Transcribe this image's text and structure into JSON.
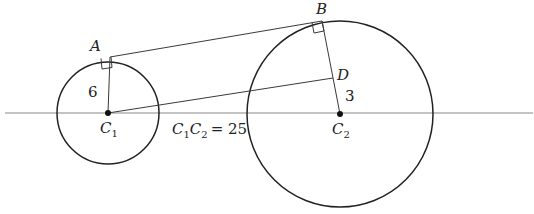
{
  "diagram": {
    "points": {
      "A": {
        "label": "A",
        "x": 110,
        "y": 57
      },
      "B": {
        "label": "B",
        "x": 322,
        "y": 21
      },
      "D": {
        "label": "D",
        "x": 333,
        "y": 78
      },
      "C1": {
        "label": "C",
        "sub": "1",
        "x": 108,
        "y": 113
      },
      "C2": {
        "label": "C",
        "sub": "2",
        "x": 340,
        "y": 114
      }
    },
    "circles": [
      {
        "name": "circle-c1",
        "cx": 108,
        "cy": 113,
        "r": 51
      },
      {
        "name": "circle-c2",
        "cx": 340,
        "cy": 114,
        "r": 93
      }
    ],
    "measurements": {
      "radius_c1": "6",
      "segment_dc2": "3",
      "distance_label_c1": "C",
      "distance_label_c1_sub": "1",
      "distance_label_c2": "C",
      "distance_label_c2_sub": "2",
      "distance_value": "= 25"
    },
    "colors": {
      "stroke": "#222222",
      "axis": "#8a8a8a",
      "background": "#ffffff"
    }
  }
}
